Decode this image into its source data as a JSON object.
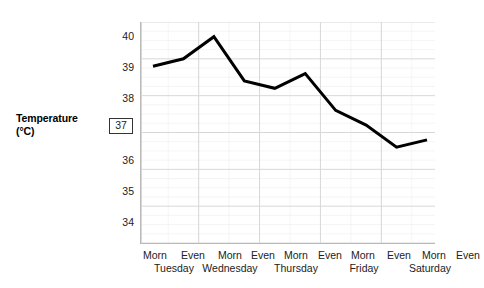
{
  "chart_data": {
    "type": "line",
    "title": "",
    "xlabel": "",
    "ylabel": "Temperature (°C)",
    "ylabel_line1": "Temperature",
    "ylabel_line2": "(°C)",
    "ylim": [
      34,
      40
    ],
    "y_ticks": [
      {
        "value": 40,
        "label": "40",
        "boxed": false
      },
      {
        "value": 39,
        "label": "39",
        "boxed": false
      },
      {
        "value": 38,
        "label": "38",
        "boxed": false
      },
      {
        "value": 37,
        "label": "37",
        "boxed": true
      },
      {
        "value": 36,
        "label": "36",
        "boxed": false
      },
      {
        "value": 35,
        "label": "35",
        "boxed": false
      },
      {
        "value": 34,
        "label": "34",
        "boxed": false
      }
    ],
    "grid": true,
    "grid_color": "#d8d8d8",
    "minor_grid_color": "#eeeeee",
    "legend": "none",
    "line_color": "#000000",
    "line_width": 3,
    "categories": [
      "Morn",
      "Even",
      "Morn",
      "Even",
      "Morn",
      "Even",
      "Morn",
      "Even",
      "Morn",
      "Even"
    ],
    "day_groups": [
      {
        "day": "Tuesday",
        "halves": [
          "Morn",
          "Even"
        ]
      },
      {
        "day": "Wednesday",
        "halves": [
          "Morn",
          "Even"
        ]
      },
      {
        "day": "Thursday",
        "halves": [
          "Morn",
          "Even"
        ]
      },
      {
        "day": "Friday",
        "halves": [
          "Morn",
          "Even"
        ]
      },
      {
        "day": "Saturday",
        "halves": [
          "Morn",
          "Even"
        ]
      }
    ],
    "values": [
      38.8,
      39.0,
      39.6,
      38.4,
      38.2,
      38.6,
      37.6,
      37.2,
      36.6,
      36.8
    ],
    "points": [
      {
        "x": "Tuesday Morn",
        "y": 38.8
      },
      {
        "x": "Tuesday Even",
        "y": 39.0
      },
      {
        "x": "Wednesday Morn",
        "y": 39.6
      },
      {
        "x": "Wednesday Even",
        "y": 38.4
      },
      {
        "x": "Thursday Morn",
        "y": 38.2
      },
      {
        "x": "Thursday Even",
        "y": 38.6
      },
      {
        "x": "Friday Morn",
        "y": 37.6
      },
      {
        "x": "Friday Even",
        "y": 37.2
      },
      {
        "x": "Saturday Morn",
        "y": 36.6
      },
      {
        "x": "Saturday Even",
        "y": 36.8
      }
    ]
  },
  "axis": {
    "y_title_line1": "Temperature",
    "y_title_line2": "(°C)",
    "tick_40": "40",
    "tick_39": "39",
    "tick_38": "38",
    "tick_37": "37",
    "tick_36": "36",
    "tick_35": "35",
    "tick_34": "34"
  },
  "x_labels": {
    "half_0": "Morn",
    "half_1": "Even",
    "half_2": "Morn",
    "half_3": "Even",
    "half_4": "Morn",
    "half_5": "Even",
    "half_6": "Morn",
    "half_7": "Even",
    "half_8": "Morn",
    "half_9": "Even",
    "day_0": "Tuesday",
    "day_1": "Wednesday",
    "day_2": "Thursday",
    "day_3": "Friday",
    "day_4": "Saturday"
  }
}
